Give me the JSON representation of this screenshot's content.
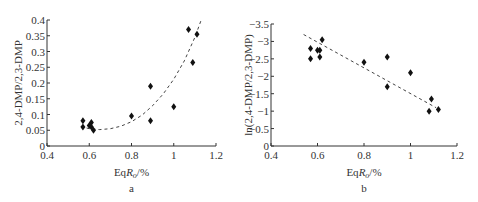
{
  "chart_data": [
    {
      "id": "a",
      "type": "scatter",
      "panel_label": "a",
      "title": "",
      "xlabel": "EqRo/%",
      "xlabel_main": "Eq",
      "xlabel_italic": "R",
      "xlabel_sub": "o",
      "xlabel_tail": "/%",
      "ylabel": "2,4-DMP/2,3-DMP",
      "xlim": [
        0.4,
        1.2
      ],
      "ylim": [
        0,
        0.4
      ],
      "xticks": [
        "0.4",
        "0.6",
        "0.8",
        "1",
        "1.2"
      ],
      "yticks": [
        "0",
        "0.05",
        "0.1",
        "0.15",
        "0.2",
        "0.25",
        "0.3",
        "0.35",
        "0.4"
      ],
      "grid": false,
      "marker": "diamond",
      "points": [
        {
          "x": 0.57,
          "y": 0.08
        },
        {
          "x": 0.57,
          "y": 0.06
        },
        {
          "x": 0.6,
          "y": 0.065
        },
        {
          "x": 0.61,
          "y": 0.075
        },
        {
          "x": 0.61,
          "y": 0.06
        },
        {
          "x": 0.62,
          "y": 0.05
        },
        {
          "x": 0.8,
          "y": 0.095
        },
        {
          "x": 0.89,
          "y": 0.19
        },
        {
          "x": 0.89,
          "y": 0.08
        },
        {
          "x": 1.0,
          "y": 0.125
        },
        {
          "x": 1.07,
          "y": 0.37
        },
        {
          "x": 1.11,
          "y": 0.355
        },
        {
          "x": 1.09,
          "y": 0.265
        }
      ],
      "trendline": {
        "kind": "exponential/polynomial (dashed)",
        "points": [
          [
            0.56,
            0.062
          ],
          [
            0.6,
            0.055
          ],
          [
            0.65,
            0.052
          ],
          [
            0.7,
            0.055
          ],
          [
            0.75,
            0.063
          ],
          [
            0.8,
            0.077
          ],
          [
            0.85,
            0.098
          ],
          [
            0.9,
            0.128
          ],
          [
            0.95,
            0.165
          ],
          [
            1.0,
            0.212
          ],
          [
            1.05,
            0.27
          ],
          [
            1.1,
            0.345
          ],
          [
            1.13,
            0.4
          ]
        ]
      }
    },
    {
      "id": "b",
      "type": "scatter",
      "panel_label": "b",
      "title": "",
      "xlabel": "EqRo/%",
      "xlabel_main": "Eq",
      "xlabel_italic": "R",
      "xlabel_sub": "o",
      "xlabel_tail": "/%",
      "ylabel": "ln(2,4-DMP/2,3-DMP)",
      "xlim": [
        0.4,
        1.2
      ],
      "ylim": [
        0,
        -3.5
      ],
      "xticks": [
        "0.4",
        "0.6",
        "0.8",
        "1",
        "1.2"
      ],
      "yticks": [
        "0",
        "-0.5",
        "-1",
        "-1.5",
        "-2",
        "-2.5",
        "-3",
        "-3.5"
      ],
      "grid": false,
      "marker": "diamond",
      "points": [
        {
          "x": 0.57,
          "y": -2.8
        },
        {
          "x": 0.57,
          "y": -2.5
        },
        {
          "x": 0.6,
          "y": -2.75
        },
        {
          "x": 0.61,
          "y": -2.75
        },
        {
          "x": 0.61,
          "y": -2.55
        },
        {
          "x": 0.62,
          "y": -3.05
        },
        {
          "x": 0.8,
          "y": -2.4
        },
        {
          "x": 0.9,
          "y": -2.55
        },
        {
          "x": 0.9,
          "y": -1.7
        },
        {
          "x": 1.0,
          "y": -2.1
        },
        {
          "x": 1.08,
          "y": -1.0
        },
        {
          "x": 1.09,
          "y": -1.35
        },
        {
          "x": 1.12,
          "y": -1.05
        }
      ],
      "trendline": {
        "kind": "linear (dashed)",
        "points": [
          [
            0.54,
            -3.2
          ],
          [
            1.11,
            -1.1
          ]
        ]
      }
    }
  ]
}
